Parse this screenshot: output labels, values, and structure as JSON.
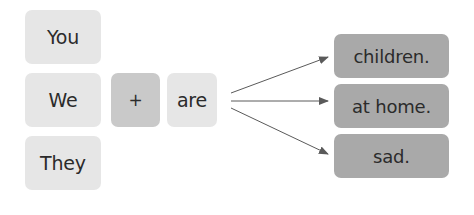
{
  "diagram": {
    "subjects": [
      "You",
      "We",
      "They"
    ],
    "operator": "+",
    "verb": "are",
    "complements": [
      "children.",
      "at home.",
      "sad."
    ],
    "colors": {
      "subject_box": "#e6e6e6",
      "operator_box": "#c9c9c9",
      "verb_box": "#e6e6e6",
      "complement_box": "#a9a9a9",
      "arrow": "#5a5a5a",
      "text": "#2b2b2b"
    }
  }
}
